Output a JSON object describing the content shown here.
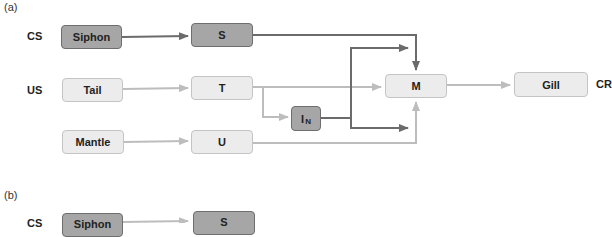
{
  "colors": {
    "dark_box_fill": "#a6a6a6",
    "dark_box_border": "#6e6e6e",
    "light_box_fill": "#ececec",
    "light_box_border": "#c4c4c4",
    "dark_arrow": "#6b6b6b",
    "light_arrow": "#bdbdbd"
  },
  "panel_a": {
    "label": "(a)",
    "row_labels": {
      "cs": "CS",
      "us": "US",
      "cr": "CR"
    },
    "boxes": {
      "siphon": "Siphon",
      "s": "S",
      "tail": "Tail",
      "t": "T",
      "mantle": "Mantle",
      "u": "U",
      "interneuron_main": "I",
      "interneuron_sub": "N",
      "m": "M",
      "gill": "Gill"
    },
    "edges": [
      {
        "from": "Siphon",
        "to": "S",
        "style": "dark"
      },
      {
        "from": "S",
        "to": "M",
        "style": "dark"
      },
      {
        "from": "Tail",
        "to": "T",
        "style": "light"
      },
      {
        "from": "T",
        "to": "M",
        "style": "light"
      },
      {
        "from": "T",
        "to": "IN",
        "style": "light"
      },
      {
        "from": "IN",
        "to": "S-M pathway",
        "style": "dark"
      },
      {
        "from": "IN",
        "to": "U-M pathway",
        "style": "dark"
      },
      {
        "from": "Mantle",
        "to": "U",
        "style": "light"
      },
      {
        "from": "U",
        "to": "M",
        "style": "light"
      },
      {
        "from": "M",
        "to": "Gill",
        "style": "light"
      }
    ]
  },
  "panel_b": {
    "label": "(b)",
    "row_labels": {
      "cs": "CS"
    },
    "boxes": {
      "siphon": "Siphon",
      "s": "S"
    }
  }
}
